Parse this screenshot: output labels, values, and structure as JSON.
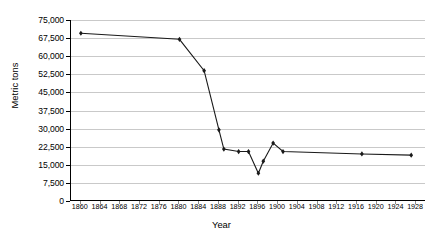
{
  "chart_data": {
    "type": "line",
    "title": "",
    "xlabel": "Year",
    "ylabel": "Metric tons",
    "xlim": [
      1858,
      1930
    ],
    "ylim": [
      0,
      75000
    ],
    "grid": true,
    "legend": "none",
    "y_ticks": [
      0,
      7500,
      15000,
      22500,
      30000,
      37500,
      45000,
      52500,
      60000,
      67500,
      75000
    ],
    "y_tick_labels": [
      "0",
      "7,500",
      "15,000",
      "22,500",
      "30,000",
      "37,500",
      "45,000",
      "52,500",
      "60,000",
      "67,500",
      "75,000"
    ],
    "x_ticks": [
      1860,
      1864,
      1868,
      1872,
      1876,
      1880,
      1884,
      1888,
      1892,
      1896,
      1900,
      1904,
      1908,
      1912,
      1916,
      1920,
      1924,
      1928
    ],
    "x_tick_labels": [
      "1860",
      "1864",
      "1868",
      "1872",
      "1876",
      "1880",
      "1884",
      "1888",
      "1892",
      "1896",
      "1900",
      "1904",
      "1908",
      "1912",
      "1916",
      "1920",
      "1924",
      "1928"
    ],
    "series": [
      {
        "name": "Metric tons",
        "marker": "diamond",
        "color": "#1a1a1a",
        "x": [
          1860,
          1880,
          1885,
          1888,
          1889,
          1892,
          1894,
          1896,
          1897,
          1899,
          1901,
          1917,
          1927
        ],
        "values": [
          69500,
          67000,
          54000,
          29500,
          21500,
          20500,
          20500,
          11500,
          16500,
          24000,
          20500,
          19500,
          19000
        ]
      }
    ]
  },
  "axes": {
    "y_title": "Metric tons",
    "x_title": "Year"
  }
}
